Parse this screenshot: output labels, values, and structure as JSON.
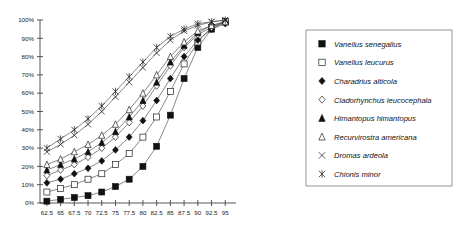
{
  "chart_data": {
    "type": "line",
    "title": "",
    "subtitle": "",
    "xlabel": "",
    "ylabel": "",
    "xlim": [
      61.25,
      95.5
    ],
    "ylim": [
      0,
      100
    ],
    "grid": false,
    "legend_position": "right",
    "x_tick_labels": [
      "62.5",
      "65",
      "67.5",
      "70",
      "72.5",
      "75",
      "77.5",
      "80",
      "82.5",
      "85",
      "87.5",
      "90",
      "92.5",
      "95"
    ],
    "x_ticks": [
      62.5,
      65,
      67.5,
      70,
      72.5,
      75,
      77.5,
      80,
      82.5,
      85,
      87.5,
      90,
      92.5,
      95
    ],
    "y_tick_labels": [
      "0%",
      "10%",
      "20%",
      "30%",
      "40%",
      "50%",
      "60%",
      "70%",
      "80%",
      "90%",
      "100%"
    ],
    "y_ticks": [
      0,
      10,
      20,
      30,
      40,
      50,
      60,
      70,
      80,
      90,
      100
    ],
    "x": [
      62.5,
      65,
      67.5,
      70,
      72.5,
      75,
      77.5,
      80,
      82.5,
      85,
      87.5,
      90,
      92.5,
      95
    ],
    "series": [
      {
        "name": "Vanellus senegallus",
        "marker": "filled-square",
        "values": [
          1,
          2,
          3,
          4,
          6,
          9,
          13,
          20,
          31,
          48,
          68,
          85,
          95,
          99
        ]
      },
      {
        "name": "Vanellus leucurus",
        "marker": "open-square",
        "values": [
          6,
          8,
          10,
          13,
          16,
          21,
          27,
          36,
          47,
          61,
          76,
          88,
          96,
          99
        ]
      },
      {
        "name": "Charadrius alticola",
        "marker": "filled-diamond",
        "values": [
          11,
          13,
          16,
          19,
          23,
          29,
          36,
          45,
          56,
          68,
          80,
          89,
          95,
          98
        ]
      },
      {
        "name": "Cladorhynchus leucocephala",
        "marker": "open-diamond",
        "values": [
          15,
          18,
          21,
          25,
          30,
          36,
          44,
          53,
          64,
          75,
          85,
          92,
          96,
          99
        ]
      },
      {
        "name": "Himantopus himantopus",
        "marker": "filled-triangle",
        "values": [
          18,
          21,
          24,
          28,
          33,
          39,
          47,
          56,
          66,
          77,
          86,
          93,
          97,
          99
        ]
      },
      {
        "name": "Recurvirostra americana",
        "marker": "open-triangle",
        "values": [
          21,
          24,
          28,
          32,
          37,
          43,
          51,
          60,
          70,
          80,
          88,
          94,
          97,
          99
        ]
      },
      {
        "name": "Dromas ardeola",
        "marker": "x-cross",
        "values": [
          28,
          32,
          37,
          43,
          50,
          58,
          66,
          74,
          82,
          89,
          94,
          97,
          99,
          100
        ]
      },
      {
        "name": "Chionis minor",
        "marker": "star-cross",
        "values": [
          30,
          35,
          40,
          46,
          53,
          61,
          69,
          77,
          85,
          91,
          95,
          98,
          99,
          100
        ]
      }
    ]
  },
  "legend": {
    "items": [
      {
        "label": "Vanellus senegallus",
        "marker": "filled-square"
      },
      {
        "label": "Vanellus leucurus",
        "marker": "open-square"
      },
      {
        "label": "Charadrius alticola",
        "marker": "filled-diamond"
      },
      {
        "label": "Cladorhynchus leucocephala",
        "marker": "open-diamond"
      },
      {
        "label": "Himantopus himantopus",
        "marker": "filled-triangle"
      },
      {
        "label": "Recurvirostra americana",
        "marker": "open-triangle"
      },
      {
        "label": "Dromas ardeola",
        "marker": "x-cross"
      },
      {
        "label": "Chionis minor",
        "marker": "star-cross"
      }
    ]
  },
  "colors": {
    "line": "#555555",
    "marker_fill": "#111111",
    "marker_open": "#ffffff",
    "axis": "#444444",
    "legend_border": "#8a8a8a",
    "background": "#ffffff"
  }
}
